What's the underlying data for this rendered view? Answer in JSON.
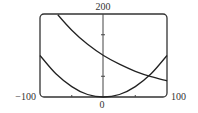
{
  "chart_data": {
    "type": "line",
    "title": "",
    "xlabel": "",
    "ylabel": "",
    "xlim": [
      -100,
      100
    ],
    "ylim": [
      0,
      200
    ],
    "grid": false,
    "legend": null,
    "tick_labels": {
      "x_min": "−100",
      "x_max": "100",
      "x_origin": "0",
      "y_max": "200"
    },
    "x_ticks": [
      -50,
      50
    ],
    "y_ticks": [
      50,
      150
    ],
    "series": [
      {
        "name": "decreasing exponential",
        "x": [
          -72,
          -50,
          -25,
          0,
          25,
          50,
          75,
          100
        ],
        "values": [
          198,
          161,
          127,
          100,
          79,
          62,
          49,
          39
        ]
      },
      {
        "name": "parabola",
        "x": [
          -100,
          -75,
          -50,
          -25,
          0,
          25,
          50,
          75,
          100
        ],
        "values": [
          100,
          56,
          25,
          6,
          0,
          6,
          25,
          56,
          100
        ]
      }
    ],
    "annotations": [
      {
        "text": "curves intersect",
        "x": 70,
        "y": 49
      }
    ]
  },
  "colors": {
    "frame": "#333333",
    "curve": "#222222",
    "axis": "#444444",
    "text": "#333333"
  }
}
